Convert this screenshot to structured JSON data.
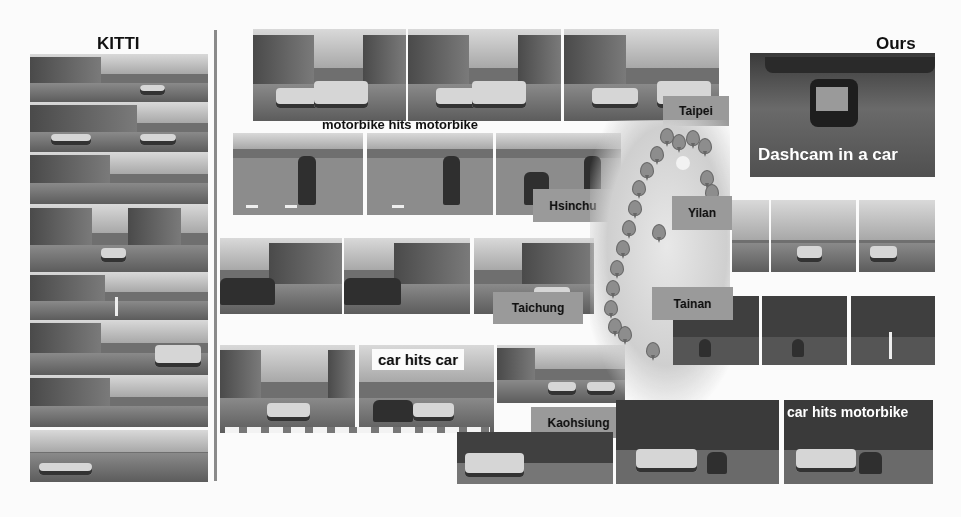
{
  "headings": {
    "left": "KITTI",
    "right": "Ours"
  },
  "captions": {
    "motorbike_motorbike": "motorbike hits motorbike",
    "car_car": "car hits car",
    "car_motorbike": "car hits motorbike",
    "dashcam": "Dashcam in a car"
  },
  "cities": [
    {
      "name": "Taipei"
    },
    {
      "name": "Hsinchu"
    },
    {
      "name": "Yilan"
    },
    {
      "name": "Taichung"
    },
    {
      "name": "Tainan"
    },
    {
      "name": "Kaohsiung"
    }
  ],
  "kitti_images": [
    {
      "label": "kitti-street-1"
    },
    {
      "label": "kitti-street-2"
    },
    {
      "label": "kitti-street-3"
    },
    {
      "label": "kitti-street-4"
    },
    {
      "label": "kitti-street-5"
    },
    {
      "label": "kitti-street-6"
    },
    {
      "label": "kitti-street-7"
    },
    {
      "label": "kitti-street-8"
    }
  ],
  "map": {
    "label": "taiwan-map-with-location-pins"
  }
}
